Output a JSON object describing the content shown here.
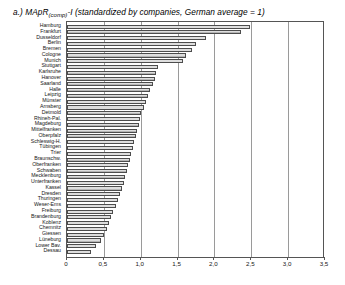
{
  "figure": {
    "caption_prefix": "a.) MApR",
    "caption_subscript": "(comp)",
    "caption_rest": "-I (standardized by companies, German average = 1)"
  },
  "chart_data": {
    "type": "bar",
    "orientation": "horizontal",
    "title": "a.) MApR(comp)-I (standardized by companies, German average = 1)",
    "xlabel": "",
    "ylabel": "",
    "xlim": [
      0,
      3.5
    ],
    "xticks": [
      0,
      0.5,
      1.0,
      1.5,
      2.0,
      2.5,
      3.0,
      3.5
    ],
    "xtick_labels": [
      "0",
      "0,5",
      "1,0",
      "1,5",
      "2,0",
      "2,5",
      "3,0",
      "3,5"
    ],
    "grid": true,
    "legend": "none",
    "bar_color": "#b6b6b6",
    "bar_edge_color": "#4d4d4d",
    "categories": [
      "Hamburg",
      "Frankfurt",
      "Dusseldorf",
      "Berlin",
      "Bremen",
      "Cologne",
      "Munich",
      "Stuttgart",
      "Karlsruhe",
      "Hanover",
      "Saarland",
      "Halle",
      "Leipzig",
      "Münster",
      "Arnsberg",
      "Detmold",
      "Rhineh-Pal.",
      "Magdeburg",
      "Mittelfranken",
      "Oberpfalz",
      "Schleswig-H.",
      "Tübingen",
      "Trier",
      "Braunschw.",
      "Oberfranken",
      "Schwaben",
      "Mecklenburg",
      "Unterfranken",
      "Kassel",
      "Dresden",
      "Thuringen",
      "Weser-Ems",
      "Freiburg",
      "Brandenburg",
      "Koblenz",
      "Chemnitz",
      "Giessen",
      "Lüneburg",
      "Lower Bav.",
      "Dessau"
    ],
    "values": [
      2.48,
      2.36,
      1.89,
      1.75,
      1.69,
      1.62,
      1.58,
      1.23,
      1.21,
      1.19,
      1.16,
      1.13,
      1.1,
      1.07,
      1.04,
      1.01,
      0.99,
      0.97,
      0.95,
      0.93,
      0.91,
      0.89,
      0.87,
      0.85,
      0.83,
      0.81,
      0.79,
      0.77,
      0.75,
      0.72,
      0.69,
      0.66,
      0.63,
      0.6,
      0.57,
      0.54,
      0.5,
      0.46,
      0.4,
      0.33
    ]
  }
}
